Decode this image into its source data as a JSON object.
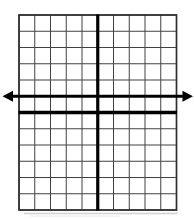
{
  "figure": {
    "background_color": "#ffffff"
  },
  "chart_data": {
    "type": "line",
    "title": "",
    "xlabel": "",
    "ylabel": "",
    "x_range": [
      -5,
      5
    ],
    "y_range": [
      -6,
      6
    ],
    "grid": true,
    "tick_labels_visible": false,
    "legend": "none",
    "colors": {
      "grid_line": "#424242",
      "grid_border": "#2e2e2e",
      "axis": "#000000",
      "series_line": "#000000",
      "shadow": "#c3c3c3"
    },
    "axes": {
      "x_axis_at_y": 0,
      "y_axis_at_x": 0,
      "arrows_on_axes": false
    },
    "series": [
      {
        "name": "horizontal-line",
        "equation": "y = 1",
        "points": [
          [
            -5,
            1
          ],
          [
            5,
            1
          ]
        ],
        "arrows": "both"
      }
    ]
  }
}
